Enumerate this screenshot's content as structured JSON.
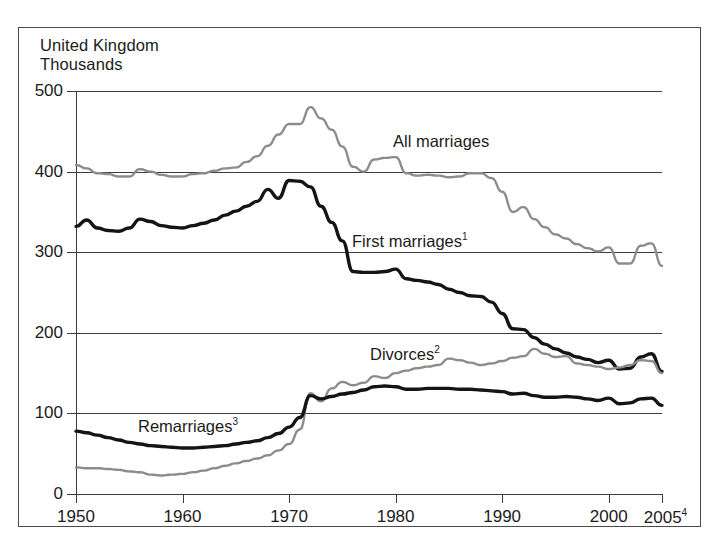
{
  "header": {
    "region": "United Kingdom",
    "units": "Thousands"
  },
  "axes": {
    "y_labels": [
      "500",
      "400",
      "300",
      "200",
      "100",
      "0"
    ],
    "x_labels": [
      "1950",
      "1960",
      "1970",
      "1980",
      "1990",
      "2000"
    ],
    "x_last_label": "2005",
    "x_last_superscript": "4"
  },
  "series_labels": {
    "all_marriages": "All marriages",
    "first_marriages": "First marriages",
    "first_marriages_superscript": "1",
    "divorces": "Divorces",
    "divorces_superscript": "2",
    "remarriages": "Remarriages",
    "remarriages_superscript": "3"
  },
  "colors": {
    "black_series": "#141414",
    "gray_series": "#8c8c8c",
    "axis": "#3c3c3c",
    "frame": "#4a4a4a",
    "text": "#1b1b1b",
    "background": "#ffffff"
  },
  "chart_data": {
    "type": "line",
    "title": "United Kingdom",
    "subtitle": "Thousands",
    "xlabel": "",
    "ylabel": "Thousands",
    "xlim": [
      1950,
      2005
    ],
    "ylim": [
      0,
      500
    ],
    "yticks": [
      0,
      100,
      200,
      300,
      400,
      500
    ],
    "xticks": [
      1950,
      1960,
      1970,
      1980,
      1990,
      2000,
      2005
    ],
    "grid": "horizontal",
    "legend": "inline-annotations",
    "x": [
      1950,
      1951,
      1952,
      1953,
      1954,
      1955,
      1956,
      1957,
      1958,
      1959,
      1960,
      1961,
      1962,
      1963,
      1964,
      1965,
      1966,
      1967,
      1968,
      1969,
      1970,
      1971,
      1972,
      1973,
      1974,
      1975,
      1976,
      1977,
      1978,
      1979,
      1980,
      1981,
      1982,
      1983,
      1984,
      1985,
      1986,
      1987,
      1988,
      1989,
      1990,
      1991,
      1992,
      1993,
      1994,
      1995,
      1996,
      1997,
      1998,
      1999,
      2000,
      2001,
      2002,
      2003,
      2004,
      2005
    ],
    "series": [
      {
        "name": "All marriages",
        "color": "#8c8c8c",
        "style": "dotted-gray",
        "values": [
          408,
          404,
          398,
          397,
          394,
          394,
          403,
          400,
          396,
          394,
          394,
          397,
          398,
          401,
          404,
          405,
          412,
          419,
          432,
          446,
          459,
          459,
          480,
          466,
          452,
          431,
          406,
          400,
          415,
          417,
          418,
          398,
          395,
          396,
          395,
          393,
          394,
          398,
          398,
          392,
          375,
          350,
          356,
          341,
          331,
          322,
          317,
          310,
          305,
          301,
          306,
          286,
          286,
          308,
          311,
          283
        ]
      },
      {
        "name": "First marriages",
        "color": "#141414",
        "style": "solid-black",
        "values": [
          332,
          340,
          330,
          327,
          326,
          330,
          341,
          338,
          333,
          331,
          330,
          333,
          336,
          340,
          346,
          351,
          357,
          363,
          378,
          367,
          389,
          388,
          381,
          357,
          337,
          314,
          276,
          275,
          275,
          276,
          279,
          267,
          265,
          263,
          260,
          254,
          250,
          246,
          245,
          238,
          224,
          205,
          204,
          194,
          186,
          180,
          175,
          170,
          167,
          163,
          166,
          155,
          156,
          170,
          174,
          152
        ]
      },
      {
        "name": "Divorces",
        "color": "#8c8c8c",
        "style": "dotted-gray",
        "values": [
          33,
          32,
          32,
          31,
          30,
          28,
          27,
          24,
          23,
          24,
          25,
          27,
          29,
          32,
          35,
          38,
          41,
          44,
          48,
          54,
          62,
          80,
          125,
          115,
          131,
          139,
          135,
          138,
          146,
          144,
          150,
          153,
          156,
          158,
          160,
          168,
          166,
          163,
          160,
          162,
          165,
          169,
          171,
          180,
          174,
          170,
          171,
          162,
          160,
          158,
          155,
          157,
          160,
          166,
          165,
          150
        ]
      },
      {
        "name": "Remarriages",
        "color": "#141414",
        "style": "solid-black",
        "values": [
          78,
          76,
          73,
          70,
          67,
          64,
          62,
          60,
          59,
          58,
          57,
          57,
          58,
          59,
          60,
          62,
          64,
          66,
          70,
          75,
          83,
          95,
          122,
          118,
          121,
          124,
          126,
          129,
          133,
          134,
          133,
          130,
          130,
          131,
          131,
          131,
          130,
          130,
          129,
          128,
          127,
          124,
          125,
          122,
          120,
          120,
          121,
          120,
          118,
          116,
          119,
          112,
          113,
          118,
          119,
          110
        ]
      }
    ]
  },
  "caption": {
    "text": ""
  }
}
